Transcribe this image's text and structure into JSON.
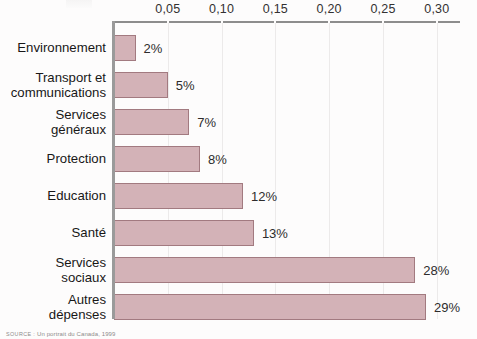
{
  "chart_data": {
    "type": "bar",
    "orientation": "horizontal",
    "title": "",
    "xlabel": "",
    "ylabel": "",
    "categories": [
      "Environnement",
      "Transport et\ncommunications",
      "Services\ngénéraux",
      "Protection",
      "Education",
      "Santé",
      "Services\nsociaux",
      "Autres\ndépenses"
    ],
    "values": [
      0.02,
      0.05,
      0.07,
      0.08,
      0.12,
      0.13,
      0.28,
      0.29
    ],
    "data_labels": [
      "2%",
      "5%",
      "7%",
      "8%",
      "12%",
      "13%",
      "28%",
      "29%"
    ],
    "xlim": [
      0,
      0.315
    ],
    "xticks": [
      0.05,
      0.1,
      0.15,
      0.2,
      0.25,
      0.3
    ],
    "xtick_labels": [
      "0,05",
      "0,10",
      "0,15",
      "0,20",
      "0,25",
      "0,30"
    ],
    "axis_position": "top",
    "grid": true,
    "legend": false,
    "bar_color": "#d3b2b7",
    "bar_border_color": "#a27a80",
    "axis_color": "#8d8d8d",
    "grid_color": "#eceaea",
    "background": "#fdfcfc"
  },
  "source": {
    "keyword": "SOURCE :",
    "text": " Un portrait du Canada, 1999"
  }
}
